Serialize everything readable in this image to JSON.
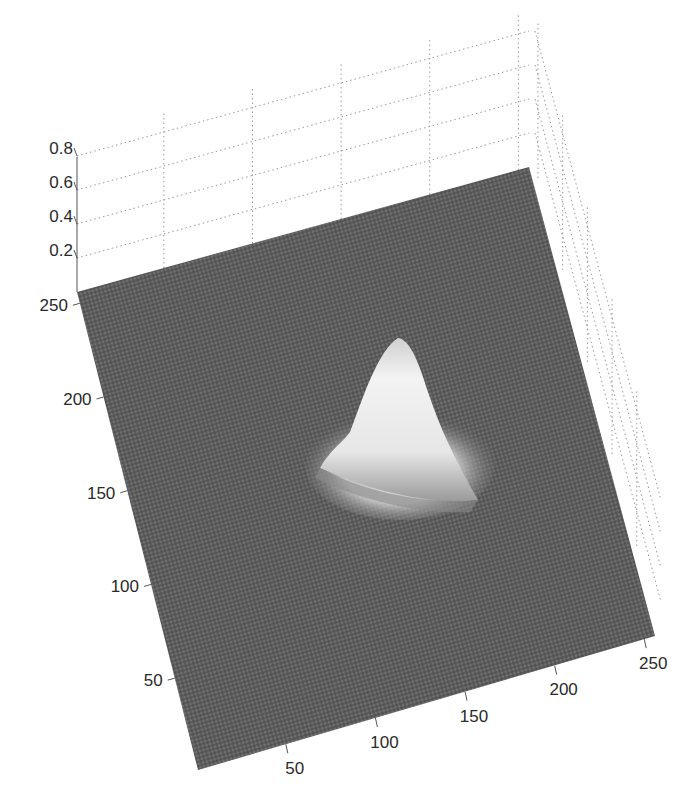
{
  "chart_data": {
    "type": "surface",
    "title": "",
    "xlabel": "",
    "ylabel": "",
    "zlabel": "",
    "x_ticks": [
      50,
      100,
      150,
      200,
      250
    ],
    "y_ticks": [
      50,
      100,
      150,
      200,
      250
    ],
    "z_ticks": [
      0.2,
      0.4,
      0.6,
      0.8
    ],
    "x_range": [
      1,
      256
    ],
    "y_range": [
      1,
      256
    ],
    "z_range": [
      0,
      0.9
    ],
    "grid": true,
    "colormap": "gray",
    "surface_description": "256x256 noisy mesh near z≈0 with a single Gaussian-like peak",
    "peak": {
      "x": 145,
      "y": 160,
      "z": 0.35,
      "sigma": 20
    },
    "noise_level": 0.02
  },
  "colors": {
    "surface_base": "#5a5a5a",
    "surface_light": "#f2f2f2",
    "grid": "#9a9a9a",
    "axis": "#555555",
    "text": "#2a2a2a"
  }
}
